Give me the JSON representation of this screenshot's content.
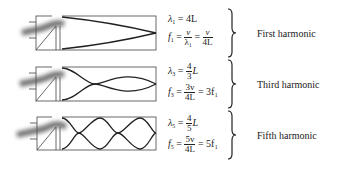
{
  "harmonics": [
    {
      "name": "First harmonic",
      "lambda_sym": "λ",
      "lambda_sub": "1",
      "lambda_val": "4L",
      "freq_sym": "f",
      "freq_sub": "1",
      "freq_frac1_num": "v",
      "freq_frac1_den": "λ₁",
      "freq_frac2_num": "v",
      "freq_frac2_den": "4L",
      "loops": 1
    },
    {
      "name": "Third harmonic",
      "lambda_sym": "λ",
      "lambda_sub": "3",
      "lambda_num": "4",
      "lambda_den": "3",
      "lambda_tail": "L",
      "freq_sym": "f",
      "freq_sub": "3",
      "freq_num": "3v",
      "freq_den": "4L",
      "freq_tail": "= 3f₁",
      "loops": 3
    },
    {
      "name": "Fifth harmonic",
      "lambda_sym": "λ",
      "lambda_sub": "5",
      "lambda_num": "4",
      "lambda_den": "5",
      "lambda_tail": "L",
      "freq_sym": "f",
      "freq_sub": "5",
      "freq_num": "5v",
      "freq_den": "4L",
      "freq_tail": "= 5f₁",
      "loops": 5
    }
  ],
  "colors": {
    "line": "#222222",
    "pipe": "#444444",
    "air": "#555555"
  }
}
